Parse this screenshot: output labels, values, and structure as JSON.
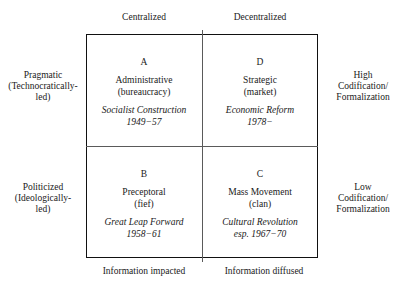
{
  "figure": {
    "axes": {
      "top_left": "Centralized",
      "top_right": "Decentralized",
      "bottom_left": "Information impacted",
      "bottom_right": "Information diffused",
      "left_top": "Pragmatic\n(Technocratically-led)",
      "left_top_line1": "Pragmatic",
      "left_top_line2": "(Technocratically-",
      "left_top_line3": "led)",
      "left_bottom_line1": "Politicized",
      "left_bottom_line2": "(Ideologically-",
      "left_bottom_line3": "led)",
      "right_top_line1": "High",
      "right_top_line2": "Codification/",
      "right_top_line3": "Formalization",
      "right_bottom_line1": "Low",
      "right_bottom_line2": "Codification/",
      "right_bottom_line3": "Formalization"
    },
    "quadrants": [
      {
        "letter": "A",
        "name": "Administrative",
        "paren": "(bureaucracy)",
        "event": "Socialist Construction",
        "years": "1949−57"
      },
      {
        "letter": "D",
        "name": "Strategic",
        "paren": "(market)",
        "event": "Economic Reform",
        "years": "1978−"
      },
      {
        "letter": "B",
        "name": "Preceptoral",
        "paren": "(fief)",
        "event": "Great Leap Forward",
        "years": "1958−61"
      },
      {
        "letter": "C",
        "name": "Mass Movement",
        "paren": "(clan)",
        "event": "Cultural Revolution",
        "years": "esp. 1967−70"
      }
    ],
    "colors": {
      "border": "#111111",
      "divider": "#5a5a5a",
      "text": "#1a1a1a",
      "background": "#ffffff"
    }
  }
}
